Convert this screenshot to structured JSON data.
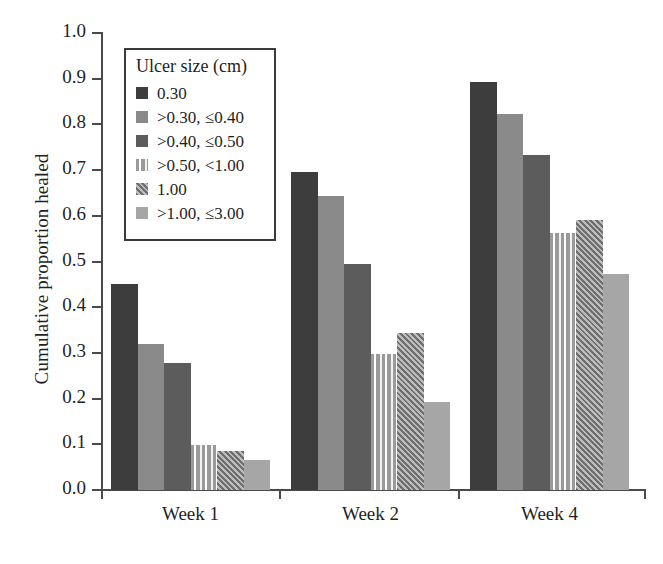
{
  "chart_data": {
    "type": "bar",
    "title": "",
    "subtitle": "",
    "xlabel": "",
    "ylabel": "Cumulative proportion healed",
    "categories": [
      "Week 1",
      "Week 2",
      "Week 4"
    ],
    "ylim": [
      0.0,
      1.0
    ],
    "ytick_labels": [
      "1.0",
      "0.9",
      "0.8",
      "0.7",
      "0.6",
      "0.5",
      "0.4",
      "0.3",
      "0.2",
      "0.1",
      "0.0"
    ],
    "ytick_values": [
      1.0,
      0.9,
      0.8,
      0.7,
      0.6,
      0.5,
      0.4,
      0.3,
      0.2,
      0.1,
      0.0
    ],
    "grid": false,
    "legend_position": "upper-left-inside",
    "legend_title": "Ulcer size (cm)",
    "series": [
      {
        "name": "0.30",
        "color": "#3d3d3d",
        "pattern": "solid",
        "values": [
          0.45,
          0.695,
          0.893
        ]
      },
      {
        "name": ">0.30, ≤0.40",
        "color": "#8a8a8a",
        "pattern": "solid",
        "values": [
          0.32,
          0.643,
          0.823
        ]
      },
      {
        "name": ">0.40, ≤0.50",
        "color": "#5c5c5c",
        "pattern": "solid",
        "values": [
          0.278,
          0.495,
          0.732
        ]
      },
      {
        "name": ">0.50, <1.00",
        "color": "#9a9a9a",
        "pattern": "vertical-stripes",
        "values": [
          0.098,
          0.297,
          0.562
        ]
      },
      {
        "name": "1.00",
        "color": "#6e6e6e",
        "pattern": "checker",
        "values": [
          0.086,
          0.343,
          0.59
        ]
      },
      {
        "name": ">1.00, ≤3.00",
        "color": "#a6a6a6",
        "pattern": "solid",
        "values": [
          0.065,
          0.193,
          0.472
        ]
      }
    ]
  },
  "axis": {
    "y_title": "Cumulative proportion healed"
  },
  "colors": {
    "axis": "#4a4a4a",
    "text": "#1f1f1f",
    "legend_border": "#3a3a3a",
    "background": "#ffffff"
  }
}
